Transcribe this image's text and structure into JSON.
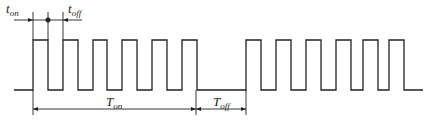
{
  "diagram": {
    "type": "pulse-train timing diagram",
    "colors": {
      "stroke": "#222222",
      "background": "#ffffff"
    },
    "labels": {
      "t_on": {
        "main": "t",
        "sub": "on"
      },
      "t_off": {
        "main": "t",
        "sub": "off"
      },
      "T_on": {
        "main": "T",
        "sub": "on"
      },
      "T_off": {
        "main": "T",
        "sub": "off"
      }
    },
    "waveform": {
      "baseline_y": 90,
      "high_y": 40,
      "start_x": 14,
      "end_x": 423,
      "burst1_pulses": [
        [
          33,
          48
        ],
        [
          63,
          78
        ],
        [
          93,
          107
        ],
        [
          122,
          137
        ],
        [
          152,
          167
        ],
        [
          182,
          197
        ]
      ],
      "burst2_pulses": [
        [
          246,
          261
        ],
        [
          276,
          291
        ],
        [
          306,
          321
        ],
        [
          336,
          351
        ],
        [
          363,
          378
        ],
        [
          389,
          404
        ]
      ]
    },
    "dimensions": {
      "t_on_span": [
        33,
        48
      ],
      "t_off_span": [
        48,
        63
      ],
      "T_on_span": [
        33,
        196
      ],
      "T_off_span": [
        196,
        246
      ],
      "top_arrow_y": 20,
      "bottom_arrow_y": 109
    }
  }
}
